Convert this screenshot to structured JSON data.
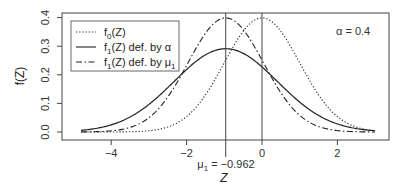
{
  "chart_data": {
    "type": "line",
    "title": "",
    "xlabel": "Z",
    "ylabel": "f(Z)",
    "xlim": [
      -5.0,
      3.4
    ],
    "ylim": [
      -0.015,
      0.415
    ],
    "x_ticks": [
      -4,
      -2,
      0,
      2
    ],
    "x_tick_labels": [
      "−4",
      "−2",
      "0",
      "2"
    ],
    "y_ticks": [
      0.0,
      0.1,
      0.2,
      0.3,
      0.4
    ],
    "y_tick_labels": [
      "0.0",
      "0.1",
      "0.2",
      "0.3",
      "0.4"
    ],
    "grid": false,
    "legend_position": "top-left",
    "x_range_plotted": [
      -4.8,
      3.0
    ],
    "series": [
      {
        "name": "f0(Z)",
        "label_main": "f",
        "label_sub": "0",
        "label_rest": "(Z)",
        "style": "dotted",
        "distribution": "normal",
        "mean": 0.0,
        "sd": 1.0,
        "peak": 0.399
      },
      {
        "name": "f1(Z) def. by α",
        "label_main": "f",
        "label_sub": "1",
        "label_rest": "(Z) def. by α",
        "style": "solid",
        "distribution": "normal",
        "mean": -0.962,
        "sd": 1.37,
        "peak": 0.291
      },
      {
        "name": "f1(Z) def. by μ1",
        "label_main": "f",
        "label_sub": "1",
        "label_rest": "(Z) def. by μ",
        "label_rest_sub": "1",
        "style": "dashdot",
        "distribution": "normal",
        "mean": -0.962,
        "sd": 1.0,
        "peak": 0.399
      }
    ],
    "vertical_lines": [
      {
        "x": -0.962,
        "label": "μ1 = −0.962",
        "extends_below_axis": true
      },
      {
        "x": 0.0,
        "label": "",
        "extends_below_axis": false
      }
    ],
    "annotations": [
      {
        "text": "α = 0.4",
        "x": 2.1,
        "y": 0.39
      }
    ]
  },
  "labels": {
    "mu_prefix": "μ",
    "mu_sub": "1",
    "mu_value": " = −0.962",
    "alpha_text": "α = 0.4",
    "xlabel": "Z",
    "ylabel": "f(Z)"
  }
}
